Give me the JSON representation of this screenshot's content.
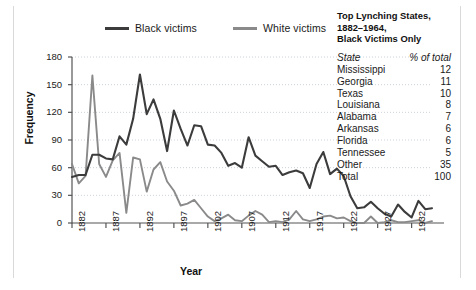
{
  "legend": {
    "items": [
      {
        "label": "Black victims",
        "color": "#3c3c3c",
        "name": "legend-black-victims"
      },
      {
        "label": "White victims",
        "color": "#8a8a8a",
        "name": "legend-white-victims"
      }
    ]
  },
  "side_table": {
    "title_line1": "Top Lynching States,",
    "title_line2": "1882–1964,",
    "title_line3": "Black Victims Only",
    "header": {
      "state": "State",
      "pct": "% of total"
    },
    "rows": [
      {
        "state": "Mississippi",
        "pct": "12"
      },
      {
        "state": "Georgia",
        "pct": "11"
      },
      {
        "state": "Texas",
        "pct": "10"
      },
      {
        "state": "Louisiana",
        "pct": "8"
      },
      {
        "state": "Alabama",
        "pct": "7"
      },
      {
        "state": "Arkansas",
        "pct": "6"
      },
      {
        "state": "Florida",
        "pct": "6"
      },
      {
        "state": "Tennessee",
        "pct": "5"
      },
      {
        "state": "Other",
        "pct": "35"
      },
      {
        "state": "Total",
        "pct": "100"
      }
    ]
  },
  "chart_data": {
    "type": "line",
    "title": "",
    "xlabel": "Year",
    "ylabel": "Frequency",
    "ylim": [
      0,
      180
    ],
    "yticks": [
      0,
      30,
      60,
      90,
      120,
      150,
      180
    ],
    "xlim": [
      1882,
      1935
    ],
    "xticks": [
      1882,
      1887,
      1892,
      1897,
      1902,
      1907,
      1912,
      1917,
      1922,
      1927,
      1932
    ],
    "grid": true,
    "legend_position": "top",
    "x": [
      1882,
      1883,
      1884,
      1885,
      1886,
      1887,
      1888,
      1889,
      1890,
      1891,
      1892,
      1893,
      1894,
      1895,
      1896,
      1897,
      1898,
      1899,
      1900,
      1901,
      1902,
      1903,
      1904,
      1905,
      1906,
      1907,
      1908,
      1909,
      1910,
      1911,
      1912,
      1913,
      1914,
      1915,
      1916,
      1917,
      1918,
      1919,
      1920,
      1921,
      1922,
      1923,
      1924,
      1925,
      1926,
      1927,
      1928,
      1929,
      1930,
      1931,
      1932,
      1933,
      1934,
      1935
    ],
    "series": [
      {
        "name": "Black victims",
        "color": "#3c3c3c",
        "values": [
          50,
          52,
          52,
          74,
          74,
          70,
          69,
          94,
          85,
          113,
          161,
          118,
          134,
          113,
          78,
          122,
          102,
          84,
          106,
          105,
          85,
          84,
          76,
          62,
          65,
          60,
          93,
          73,
          67,
          61,
          62,
          52,
          55,
          57,
          54,
          38,
          64,
          77,
          53,
          59,
          51,
          29,
          16,
          17,
          23,
          16,
          10,
          7,
          20,
          12,
          6,
          24,
          15,
          16
        ]
      },
      {
        "name": "White victims",
        "color": "#8a8a8a",
        "values": [
          64,
          43,
          51,
          160,
          64,
          50,
          68,
          76,
          11,
          71,
          69,
          34,
          58,
          66,
          45,
          35,
          19,
          21,
          25,
          16,
          7,
          2,
          5,
          9,
          3,
          2,
          8,
          13,
          9,
          1,
          2,
          1,
          4,
          13,
          4,
          2,
          4,
          7,
          8,
          5,
          6,
          2,
          0,
          0,
          7,
          0,
          1,
          3,
          1,
          1,
          2,
          3,
          0,
          2
        ]
      }
    ]
  }
}
